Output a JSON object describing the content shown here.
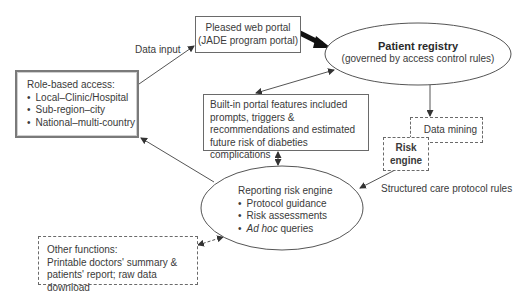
{
  "role_box": {
    "title": "Role-based access:",
    "items": [
      "Local–Clinic/Hospital",
      "Sub-region–city",
      "National–multi-country"
    ]
  },
  "portal_box": {
    "line1": "Pleased web portal",
    "line2": "(JADE program portal)"
  },
  "data_input_label": "Data input",
  "registry": {
    "title": "Patient registry",
    "subtitle": "(governed by access control rules)"
  },
  "features_box": {
    "text": "Built-in portal features included prompts, triggers & recommendations and estimated future risk of diabeties complications"
  },
  "data_mining": {
    "label": "Data mining"
  },
  "risk_engine": {
    "line1": "Risk",
    "line2": "engine"
  },
  "protocol_rules_label": "Structured care protocol rules",
  "reporting": {
    "title": "Reporting risk engine",
    "items": [
      "Protocol guidance",
      "Risk assessments"
    ],
    "adhoc_italic": "Ad hoc",
    "adhoc_rest": " queries"
  },
  "other_box": {
    "title": "Other functions:",
    "line1": "Printable doctors' summary &",
    "line2": "patients' report; raw data download"
  }
}
